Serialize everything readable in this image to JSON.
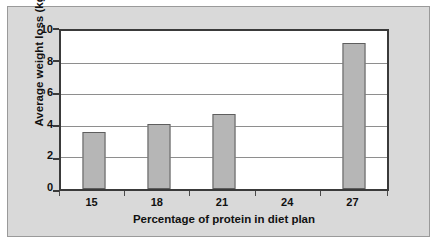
{
  "chart_data": {
    "type": "bar",
    "title": "",
    "subtitle": "",
    "xlabel": "Percentage of protein in diet plan",
    "ylabel": "Average weight loss (kg)",
    "categories": [
      "15",
      "18",
      "21",
      "24",
      "27"
    ],
    "values": [
      3.5,
      4.0,
      4.6,
      0,
      9.0
    ],
    "series": [
      {
        "name": "Average weight loss",
        "values": [
          3.5,
          4.0,
          4.6,
          0,
          9.0
        ]
      }
    ],
    "ylim": [
      0,
      10
    ],
    "xlim": [
      0,
      5
    ],
    "ytick_labels": [
      "0",
      "2",
      "4",
      "6",
      "8",
      "10"
    ],
    "ytick_values": [
      0,
      2,
      4,
      6,
      8,
      10
    ],
    "grid": "horizontal",
    "legend": "none",
    "bar_color": "#b6b6b6",
    "bar_border_color": "#5e5e5e",
    "axis_color": "#3a3a3a",
    "gridline_color": "#8e8e8e",
    "plot_background": "#ffffff",
    "panel_background": "#d9d9d9",
    "panel_border_color": "#9a9a9a",
    "annotations": []
  }
}
